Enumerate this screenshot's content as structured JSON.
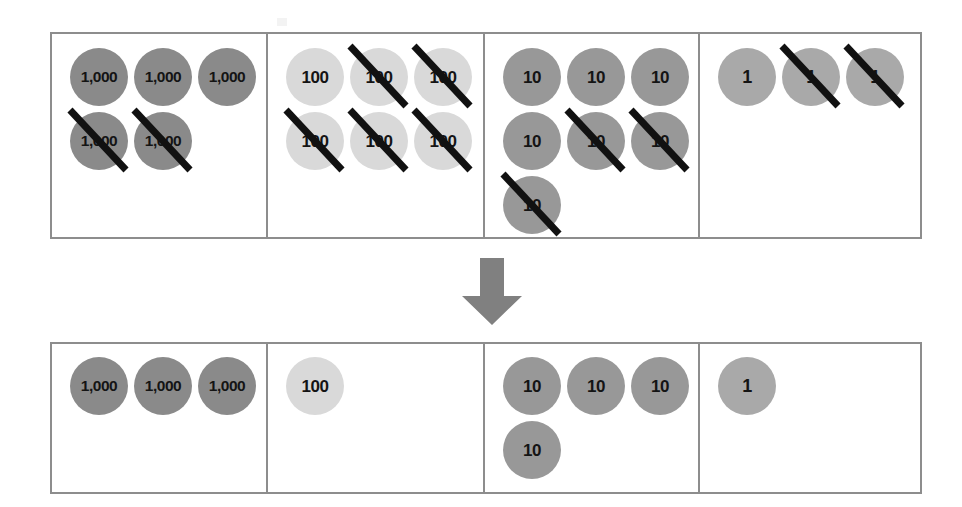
{
  "colors": {
    "disc_thousands": "#8a8a8a",
    "disc_hundreds": "#d9d9d9",
    "disc_tens": "#989898",
    "disc_ones": "#a9a9a9",
    "border": "#8d8d8d",
    "slash": "#111111",
    "arrow": "#808080",
    "text": "#141414",
    "background": "#ffffff"
  },
  "arrow": {
    "icon": "arrow-down-icon",
    "direction": "down",
    "color": "#808080"
  },
  "top_table": {
    "name": "starting-amount-table",
    "columns": [
      {
        "place": "thousands",
        "label": "1,000",
        "total": 5,
        "crossed_out": 2,
        "remaining": 3,
        "discs": [
          {
            "label": "1,000",
            "crossed": false
          },
          {
            "label": "1,000",
            "crossed": false
          },
          {
            "label": "1,000",
            "crossed": false
          },
          {
            "label": "1,000",
            "crossed": true
          },
          {
            "label": "1,000",
            "crossed": true
          }
        ]
      },
      {
        "place": "hundreds",
        "label": "100",
        "total": 6,
        "crossed_out": 5,
        "remaining": 1,
        "discs": [
          {
            "label": "100",
            "crossed": false
          },
          {
            "label": "100",
            "crossed": true
          },
          {
            "label": "100",
            "crossed": true
          },
          {
            "label": "100",
            "crossed": true
          },
          {
            "label": "100",
            "crossed": true
          },
          {
            "label": "100",
            "crossed": true
          }
        ]
      },
      {
        "place": "tens",
        "label": "10",
        "total": 7,
        "crossed_out": 3,
        "remaining": 4,
        "discs": [
          {
            "label": "10",
            "crossed": false
          },
          {
            "label": "10",
            "crossed": false
          },
          {
            "label": "10",
            "crossed": false
          },
          {
            "label": "10",
            "crossed": false
          },
          {
            "label": "10",
            "crossed": true
          },
          {
            "label": "10",
            "crossed": true
          },
          {
            "label": "10",
            "crossed": true
          }
        ]
      },
      {
        "place": "ones",
        "label": "1",
        "total": 3,
        "crossed_out": 2,
        "remaining": 1,
        "discs": [
          {
            "label": "1",
            "crossed": false
          },
          {
            "label": "1",
            "crossed": true
          },
          {
            "label": "1",
            "crossed": true
          }
        ]
      }
    ]
  },
  "bottom_table": {
    "name": "result-amount-table",
    "columns": [
      {
        "place": "thousands",
        "label": "1,000",
        "total": 3,
        "crossed_out": 0,
        "discs": [
          {
            "label": "1,000",
            "crossed": false
          },
          {
            "label": "1,000",
            "crossed": false
          },
          {
            "label": "1,000",
            "crossed": false
          }
        ]
      },
      {
        "place": "hundreds",
        "label": "100",
        "total": 1,
        "crossed_out": 0,
        "discs": [
          {
            "label": "100",
            "crossed": false
          }
        ]
      },
      {
        "place": "tens",
        "label": "10",
        "total": 4,
        "crossed_out": 0,
        "discs": [
          {
            "label": "10",
            "crossed": false
          },
          {
            "label": "10",
            "crossed": false
          },
          {
            "label": "10",
            "crossed": false
          },
          {
            "label": "10",
            "crossed": false
          }
        ]
      },
      {
        "place": "ones",
        "label": "1",
        "total": 1,
        "crossed_out": 0,
        "discs": [
          {
            "label": "1",
            "crossed": false
          }
        ]
      }
    ]
  }
}
